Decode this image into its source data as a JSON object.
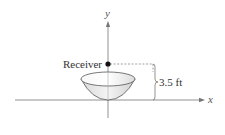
{
  "diagram": {
    "type": "parabolic-dish-cross-section",
    "axes": {
      "x_label": "x",
      "y_label": "y"
    },
    "receiver": {
      "label": "Receiver"
    },
    "dimension": {
      "label": "3.5 ft",
      "value": 3.5,
      "unit": "ft",
      "meaning": "height of receiver (focus) above vertex"
    },
    "colors": {
      "line": "#555555",
      "axis": "#666666",
      "dish_fill": "#e6e6e6",
      "dish_inner": "#f2f2f2",
      "dot": "#111111"
    }
  }
}
